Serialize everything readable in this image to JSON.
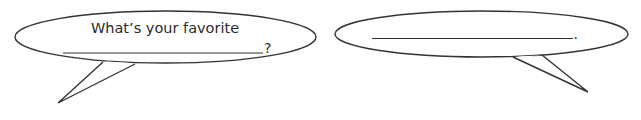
{
  "bubbles": [
    {
      "id": "left",
      "line1": "What’s your favorite",
      "blank_end": "?"
    },
    {
      "id": "right",
      "blank_end": "."
    }
  ],
  "colors": {
    "stroke": "#333333",
    "fill": "#ffffff",
    "text": "#2a2a2a"
  }
}
